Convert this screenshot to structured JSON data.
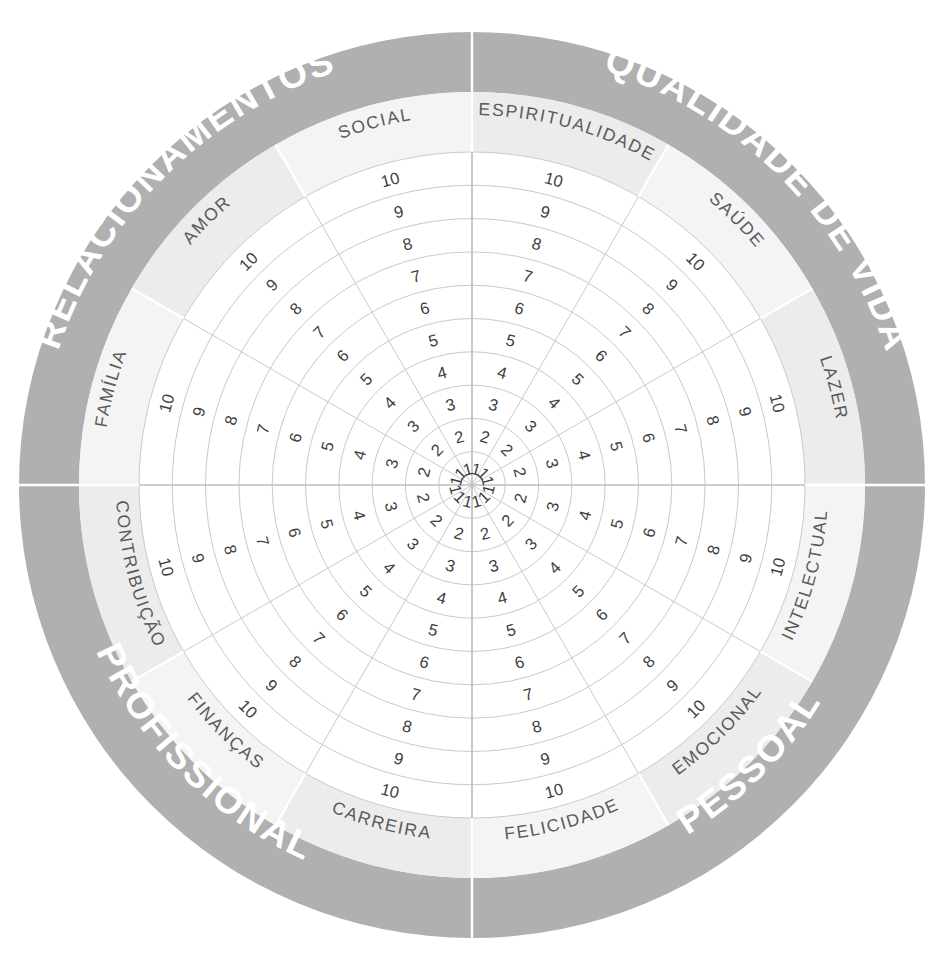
{
  "chart_data": {
    "type": "pie",
    "center": {
      "x": 472,
      "y": 485
    },
    "radii": {
      "hub": 0,
      "grid_outer": 333,
      "band_outer": 393,
      "wheel_outer": 453
    },
    "scale": {
      "min": 1,
      "max": 10,
      "labels": [
        "1",
        "2",
        "3",
        "4",
        "5",
        "6",
        "7",
        "8",
        "9",
        "10"
      ]
    },
    "sector_count": 12,
    "sector_span_degrees": 30,
    "grid": true,
    "legend": "none",
    "colors": {
      "quadrant_band": "#b0b0b0",
      "label_band": "#ececec",
      "label_band_alt": "#f4f4f4",
      "grid_line": "#c9c9c9",
      "quadrant_text": "#ffffff",
      "area_text": "#5a5a5a",
      "scale_text": "#404040",
      "background": "#ffffff"
    },
    "quadrants": [
      {
        "label": "QUALIDADE DE VIDA",
        "start_deg": -90,
        "end_deg": 0
      },
      {
        "label": "PESSOAL",
        "start_deg": 0,
        "end_deg": 90
      },
      {
        "label": "PROFISSIONAL",
        "start_deg": 90,
        "end_deg": 180
      },
      {
        "label": "RELACIONAMENTOS",
        "start_deg": 180,
        "end_deg": 270
      }
    ],
    "categories": [
      {
        "label": "LAZER",
        "start_deg": -30,
        "end_deg": 0,
        "quadrant": "QUALIDADE DE VIDA"
      },
      {
        "label": "INTELECTUAL",
        "start_deg": 0,
        "end_deg": 30,
        "quadrant": "PESSOAL"
      },
      {
        "label": "EMOCIONAL",
        "start_deg": 30,
        "end_deg": 60,
        "quadrant": "PESSOAL"
      },
      {
        "label": "FELICIDADE",
        "start_deg": 60,
        "end_deg": 90,
        "quadrant": "PESSOAL"
      },
      {
        "label": "CARREIRA",
        "start_deg": 90,
        "end_deg": 120,
        "quadrant": "PROFISSIONAL"
      },
      {
        "label": "FINANÇAS",
        "start_deg": 120,
        "end_deg": 150,
        "quadrant": "PROFISSIONAL"
      },
      {
        "label": "CONTRIBUIÇÃO",
        "start_deg": 150,
        "end_deg": 180,
        "quadrant": "PROFISSIONAL"
      },
      {
        "label": "FAMÍLIA",
        "start_deg": 180,
        "end_deg": 210,
        "quadrant": "RELACIONAMENTOS"
      },
      {
        "label": "AMOR",
        "start_deg": 210,
        "end_deg": 240,
        "quadrant": "RELACIONAMENTOS"
      },
      {
        "label": "SOCIAL",
        "start_deg": 240,
        "end_deg": 270,
        "quadrant": "RELACIONAMENTOS"
      },
      {
        "label": "ESPIRITUALIDADE",
        "start_deg": 270,
        "end_deg": 300,
        "quadrant": "QUALIDADE DE VIDA"
      },
      {
        "label": "SAÚDE",
        "start_deg": 300,
        "end_deg": 330,
        "quadrant": "QUALIDADE DE VIDA"
      }
    ],
    "values": [
      null,
      null,
      null,
      null,
      null,
      null,
      null,
      null,
      null,
      null,
      null,
      null
    ],
    "xlabel": "",
    "ylabel": "",
    "annotations": []
  }
}
